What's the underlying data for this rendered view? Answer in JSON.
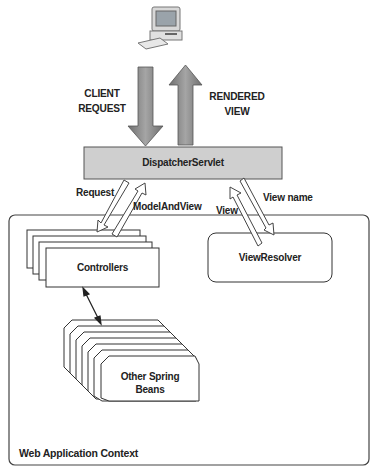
{
  "diagram": {
    "client": {
      "icon": "desktop-computer-icon"
    },
    "client_request_label": [
      "CLIENT",
      "REQUEST"
    ],
    "rendered_view_label": [
      "RENDERED",
      "VIEW"
    ],
    "dispatcher": {
      "label": "DispatcherServlet",
      "fill": "#cfcfcf"
    },
    "edges": {
      "request": "Request",
      "model_and_view": "ModelAndView",
      "view": "View",
      "view_name": "View name"
    },
    "controllers": {
      "label": "Controllers"
    },
    "view_resolver": {
      "label": "ViewResolver"
    },
    "other_beans": {
      "label_line1": "Other Spring",
      "label_line2": "Beans"
    },
    "context": {
      "label": "Web Application Context"
    },
    "colors": {
      "arrow_fill": "#8a8a8a",
      "box_stroke": "#333333",
      "servlet_fill": "#cfcfcf"
    }
  }
}
